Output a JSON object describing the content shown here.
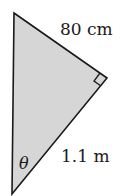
{
  "diagram": {
    "type": "right-triangle",
    "fill_color": "#d6d6d6",
    "stroke_color": "#1a1a1a",
    "vertices": {
      "top": [
        14,
        13
      ],
      "right_angle": [
        107,
        78
      ],
      "bottom": [
        12,
        194
      ]
    },
    "labels": {
      "hypotenuse_side": "80 cm",
      "lower_side": "1.1 m",
      "angle": "θ"
    }
  }
}
